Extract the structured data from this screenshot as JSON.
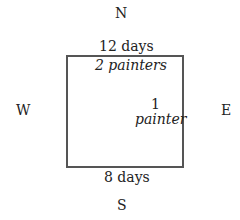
{
  "compass": {
    "north": "N",
    "south": "S",
    "west": "W",
    "east": "E"
  },
  "room": {
    "top_edge_label": "12 days",
    "top_inner_label": "2 painters",
    "right_inner_number": "1",
    "right_inner_word": "painter",
    "bottom_edge_label": "8 days",
    "border_color": "#555555"
  }
}
